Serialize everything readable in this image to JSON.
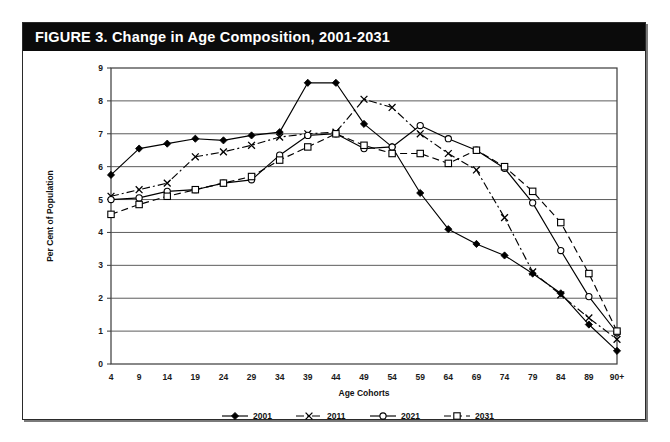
{
  "figure": {
    "title": "FIGURE 3. Change in Age Composition, 2001-2031",
    "title_bar_color": "#0b0b0b",
    "title_text_color": "#ffffff",
    "border_color": "#2a2a2a",
    "background": "#ffffff"
  },
  "chart_data": {
    "type": "line",
    "title": "FIGURE 3. Change in Age Composition, 2001-2031",
    "xlabel": "Age Cohorts",
    "ylabel": "Per Cent of Population",
    "categories": [
      "4",
      "9",
      "14",
      "19",
      "24",
      "29",
      "34",
      "39",
      "44",
      "49",
      "54",
      "59",
      "64",
      "69",
      "74",
      "79",
      "84",
      "89",
      "90+"
    ],
    "ylim": [
      0,
      9
    ],
    "yticks": [
      "0",
      "1",
      "2",
      "3",
      "4",
      "5",
      "6",
      "7",
      "8",
      "9"
    ],
    "grid": "horizontal",
    "legend_position": "bottom",
    "series": [
      {
        "name": "2001",
        "line_style": "solid",
        "marker": "filled-diamond",
        "color": "#000000",
        "values": [
          5.75,
          6.55,
          6.7,
          6.85,
          6.8,
          6.95,
          7.05,
          8.55,
          8.55,
          7.3,
          6.6,
          5.2,
          4.1,
          3.65,
          3.3,
          2.75,
          2.15,
          1.2,
          0.4
        ]
      },
      {
        "name": "2011",
        "line_style": "dash-dot",
        "marker": "cross-x",
        "color": "#000000",
        "values": [
          5.1,
          5.3,
          5.5,
          6.3,
          6.45,
          6.65,
          6.9,
          7.0,
          7.05,
          8.05,
          7.8,
          7.0,
          6.4,
          5.9,
          4.45,
          2.8,
          2.1,
          1.4,
          0.75
        ]
      },
      {
        "name": "2021",
        "line_style": "solid",
        "marker": "open-circle",
        "color": "#000000",
        "values": [
          5.0,
          5.05,
          5.25,
          5.3,
          5.5,
          5.6,
          6.35,
          6.95,
          7.0,
          6.55,
          6.6,
          7.25,
          6.85,
          6.5,
          5.95,
          4.9,
          3.45,
          2.05,
          0.95
        ]
      },
      {
        "name": "2031",
        "line_style": "dashed",
        "marker": "open-square",
        "color": "#000000",
        "values": [
          4.55,
          4.85,
          5.1,
          5.3,
          5.5,
          5.7,
          6.2,
          6.6,
          7.0,
          6.65,
          6.4,
          6.4,
          6.1,
          6.5,
          6.0,
          5.25,
          4.3,
          2.75,
          1.0
        ]
      }
    ]
  }
}
